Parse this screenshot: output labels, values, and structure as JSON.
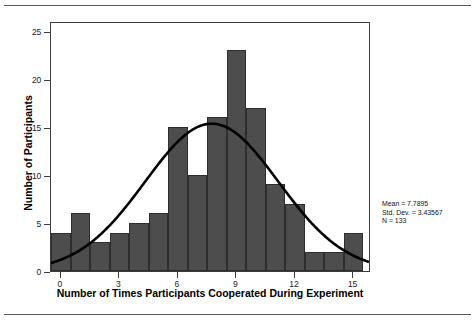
{
  "figure": {
    "rule_top": "horizontal-rule",
    "rule_bottom": "horizontal-rule"
  },
  "stats": {
    "mean_line": "Mean = 7.7895",
    "std_line": "Std. Dev. = 3.43567",
    "n_line": "N = 133"
  },
  "chart_data": {
    "type": "bar",
    "title": "",
    "xlabel": "Number of Times Participants Cooperated During Experiment",
    "ylabel": "Number of Participants",
    "categories": [
      "0",
      "1",
      "2",
      "3",
      "4",
      "5",
      "6",
      "7",
      "8",
      "9",
      "10",
      "11",
      "12",
      "13",
      "14",
      "15"
    ],
    "values": [
      4,
      6,
      3,
      4,
      5,
      6,
      15,
      10,
      16,
      23,
      17,
      9,
      7,
      2,
      2,
      4
    ],
    "xlim": [
      -0.5,
      15.9
    ],
    "ylim": [
      0,
      26
    ],
    "xticks": [
      0,
      3,
      6,
      9,
      12,
      15
    ],
    "xtick_labels": [
      "0",
      "3",
      "6",
      "9",
      "12",
      "15"
    ],
    "yticks": [
      0,
      5,
      10,
      15,
      20,
      25
    ],
    "ytick_labels": [
      "0",
      "5",
      "10",
      "15",
      "20",
      "25"
    ],
    "grid": false,
    "legend": "none",
    "bar_color": "#4d4d4d",
    "bar_edge_color": "#2e2e2e",
    "frame_color": "#3c3c3c",
    "overlay": {
      "type": "normal-curve",
      "color": "#000000",
      "mean": 7.7895,
      "std_dev": 3.43567,
      "n": 133,
      "bin_width": 1,
      "peak_value": 15.45
    }
  }
}
